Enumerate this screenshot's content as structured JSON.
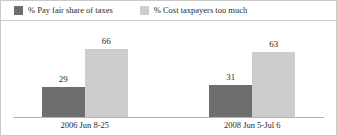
{
  "chart_data": {
    "type": "bar",
    "title": "",
    "subtitle": "",
    "xlabel": "",
    "ylabel": "",
    "ylim": [
      0,
      80
    ],
    "grid": false,
    "legend_position": "top-left",
    "categories": [
      "2006 Jun 8-25",
      "2008 Jun 5-Jul 6"
    ],
    "series": [
      {
        "name": "% Pay fair share of taxes",
        "color": "#6e6e6e",
        "values": [
          29,
          66
        ]
      },
      {
        "name": "% Cost taxpayers too much",
        "color": "#cdcdcd",
        "values": [
          31,
          63
        ]
      }
    ],
    "groups": [
      {
        "label": "2006 Jun 8-25",
        "bars": [
          {
            "series": "% Pay fair share of taxes",
            "value": 29,
            "label": "29",
            "color": "#6e6e6e"
          },
          {
            "series": "% Cost taxpayers too much",
            "value": 66,
            "label": "66",
            "color": "#cdcdcd"
          }
        ]
      },
      {
        "label": "2008 Jun 5-Jul 6",
        "bars": [
          {
            "series": "% Pay fair share of taxes",
            "value": 31,
            "label": "31",
            "color": "#6e6e6e"
          },
          {
            "series": "% Cost taxpayers too much",
            "value": 63,
            "label": "63",
            "color": "#cdcdcd"
          }
        ]
      }
    ]
  },
  "legend": {
    "items": [
      {
        "label": "% Pay fair share of taxes",
        "color": "#6e6e6e",
        "swatch_name": "legend-swatch-pay-fair-share"
      },
      {
        "label": "% Cost taxpayers too much",
        "color": "#cdcdcd",
        "swatch_name": "legend-swatch-cost-taxpayers"
      }
    ]
  },
  "colors": {
    "series_dark": "#6e6e6e",
    "series_light": "#cdcdcd",
    "axis": "#b3b3b3",
    "border": "#c9c9c9",
    "text": "#2b2b2b",
    "background": "#ffffff"
  }
}
